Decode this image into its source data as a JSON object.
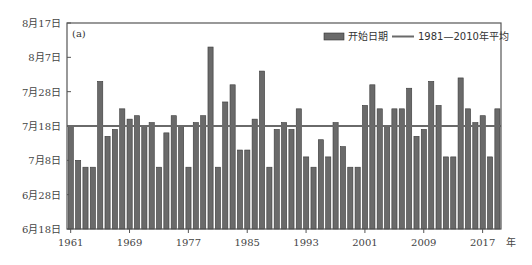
{
  "chart_data": {
    "type": "bar",
    "title": "",
    "panel_label": "(a)",
    "xlabel": "年",
    "ylabel": "",
    "x_tick_labels": [
      "1961",
      "1969",
      "1977",
      "1985",
      "1993",
      "2001",
      "2009",
      "2017"
    ],
    "x_unit_label": "年",
    "y_tick_labels": [
      "6月18日",
      "6月28日",
      "7月8日",
      "7月18日",
      "7月28日",
      "8月7日",
      "8月17日"
    ],
    "ylim_days_from_jun18": [
      0,
      60
    ],
    "y_tick_days": [
      0,
      10,
      20,
      30,
      40,
      50,
      60
    ],
    "legend": {
      "position": "top-right",
      "entries": [
        {
          "type": "bar",
          "label": "开始日期"
        },
        {
          "type": "line",
          "label": "1981—2010年平均"
        }
      ]
    },
    "categories": [
      "1961",
      "1962",
      "1963",
      "1964",
      "1965",
      "1966",
      "1967",
      "1968",
      "1969",
      "1970",
      "1971",
      "1972",
      "1973",
      "1974",
      "1975",
      "1976",
      "1977",
      "1978",
      "1979",
      "1980",
      "1981",
      "1982",
      "1983",
      "1984",
      "1985",
      "1986",
      "1987",
      "1988",
      "1989",
      "1990",
      "1991",
      "1992",
      "1993",
      "1994",
      "1995",
      "1996",
      "1997",
      "1998",
      "1999",
      "2000",
      "2001",
      "2002",
      "2003",
      "2004",
      "2005",
      "2006",
      "2007",
      "2008",
      "2009",
      "2010",
      "2011",
      "2012",
      "2013",
      "2014",
      "2015",
      "2016",
      "2017",
      "2018",
      "2019"
    ],
    "series": [
      {
        "name": "开始日期",
        "values_dates": [
          "7月18日",
          "7月8日",
          "7月6日",
          "7月6日",
          "7月31日",
          "7月15日",
          "7月17日",
          "7月23日",
          "7月20日",
          "7月21日",
          "7月18日",
          "7月19日",
          "7月6日",
          "7月16日",
          "7月21日",
          "7月18日",
          "7月6日",
          "7月19日",
          "7月21日",
          "8月10日",
          "7月6日",
          "7月25日",
          "7月30日",
          "7月11日",
          "7月11日",
          "7月20日",
          "8月3日",
          "7月6日",
          "7月17日",
          "7月19日",
          "7月17日",
          "7月23日",
          "7月9日",
          "7月6日",
          "7月14日",
          "7月9日",
          "7月19日",
          "7月12日",
          "7月6日",
          "7月6日",
          "7月24日",
          "7月30日",
          "7月23日",
          "7月18日",
          "7月23日",
          "7月23日",
          "7月29日",
          "7月15日",
          "7月17日",
          "7月31日",
          "7月24日",
          "7月9日",
          "7月9日",
          "8月1日",
          "7月23日",
          "7月19日",
          "7月21日",
          "7月9日",
          "7月23日"
        ],
        "values": [
          30,
          20,
          18,
          18,
          43,
          27,
          29,
          35,
          32,
          33,
          30,
          31,
          18,
          28,
          33,
          30,
          18,
          31,
          33,
          53,
          18,
          37,
          42,
          23,
          23,
          32,
          46,
          18,
          29,
          31,
          29,
          35,
          21,
          18,
          26,
          21,
          31,
          24,
          18,
          18,
          36,
          42,
          35,
          30,
          35,
          35,
          41,
          27,
          29,
          43,
          36,
          21,
          21,
          44,
          35,
          31,
          33,
          21,
          35
        ],
        "unit": "days after 6月18日",
        "color": "#6a6a6a"
      },
      {
        "name": "1981—2010年平均",
        "type": "hline",
        "value": 30,
        "value_date": "7月18日",
        "color": "#6a6a6a"
      }
    ],
    "grid": false
  }
}
